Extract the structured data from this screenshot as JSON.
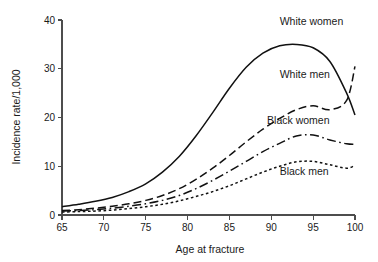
{
  "chart_data": {
    "type": "line",
    "title": "",
    "xlabel": "Age at fracture",
    "ylabel": "Incidence rate/1,000",
    "xlim": [
      65,
      100
    ],
    "ylim": [
      0,
      40
    ],
    "xticks": [
      65,
      70,
      75,
      80,
      85,
      90,
      95,
      100
    ],
    "yticks": [
      0,
      10,
      20,
      30,
      40
    ],
    "grid": false,
    "legend_position": "inline-annotations",
    "x": [
      65,
      67,
      69,
      71,
      73,
      75,
      77,
      79,
      81,
      83,
      85,
      87,
      89,
      91,
      93,
      95,
      97,
      99,
      100
    ],
    "series": [
      {
        "name": "White women",
        "label": "White women",
        "dash": "solid",
        "values": [
          1.7,
          2.2,
          2.8,
          3.6,
          4.8,
          6.4,
          8.8,
          12.0,
          16.2,
          21.0,
          26.0,
          30.3,
          33.2,
          34.7,
          35.0,
          34.3,
          31.5,
          25.0,
          20.5
        ]
      },
      {
        "name": "White men",
        "label": "White men",
        "dash": "dashed",
        "values": [
          0.9,
          1.1,
          1.4,
          1.8,
          2.3,
          3.0,
          4.0,
          5.4,
          7.3,
          9.6,
          12.2,
          15.0,
          17.6,
          19.8,
          21.6,
          22.4,
          21.6,
          23.5,
          30.5
        ]
      },
      {
        "name": "Black women",
        "label": "Black women",
        "dash": "dash-dot",
        "values": [
          0.8,
          0.9,
          1.1,
          1.4,
          1.8,
          2.3,
          3.0,
          4.0,
          5.4,
          7.1,
          9.0,
          11.0,
          13.0,
          14.7,
          16.2,
          16.4,
          15.4,
          14.6,
          14.5
        ]
      },
      {
        "name": "Black men",
        "label": "Black men",
        "dash": "dotted",
        "values": [
          0.6,
          0.7,
          0.8,
          1.0,
          1.3,
          1.7,
          2.2,
          2.9,
          3.8,
          4.8,
          6.0,
          7.4,
          8.8,
          10.0,
          10.9,
          11.0,
          10.3,
          9.6,
          10.2
        ]
      }
    ],
    "annotations": [
      {
        "text": "White women",
        "x": 91.0,
        "y": 39.0
      },
      {
        "text": "White men",
        "x": 91.0,
        "y": 28.2
      },
      {
        "text": "Black women",
        "x": 89.5,
        "y": 18.6
      },
      {
        "text": "Black men",
        "x": 91.0,
        "y": 8.3
      }
    ]
  },
  "colors": {
    "axis": "#4d4d4d",
    "line": "#111111",
    "text": "#1a1a1a",
    "background": "#ffffff"
  }
}
